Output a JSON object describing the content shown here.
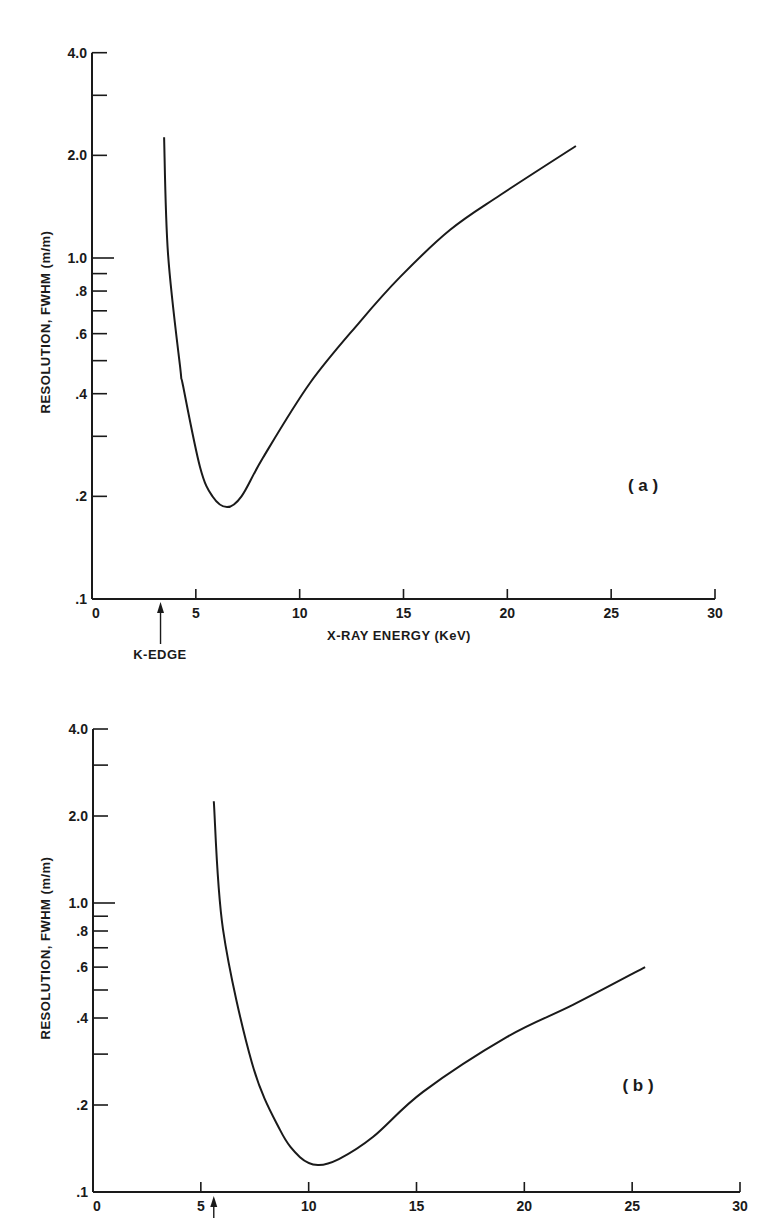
{
  "chart_data": [
    {
      "type": "line",
      "panel": "(a)",
      "title": "",
      "xlabel": "X-RAY ENERGY (KeV)",
      "ylabel": "RESOLUTION, FWHM (m/m)",
      "xscale": "linear",
      "yscale": "log",
      "xlim": [
        0,
        30
      ],
      "ylim": [
        0.1,
        4.0
      ],
      "xticks": [
        0,
        5,
        10,
        15,
        20,
        25,
        30
      ],
      "xtick_labels": [
        "0",
        "5",
        "10",
        "15",
        "20",
        "25",
        "30"
      ],
      "yticks_labeled": [
        0.1,
        0.2,
        0.4,
        0.6,
        0.8,
        1.0,
        2.0,
        4.0
      ],
      "ytick_labels": [
        ".1",
        ".2",
        ".4",
        ".6",
        ".8",
        "1.0",
        "2.0",
        "4.0"
      ],
      "yticks_minor": [
        0.3,
        0.5,
        0.7,
        0.9,
        3.0
      ],
      "grid": false,
      "annotations": [
        {
          "text": "K-EDGE",
          "x": 3.3,
          "type": "arrow-up"
        }
      ],
      "series": [
        {
          "name": "resolution",
          "x": [
            3.47,
            3.66,
            4.24,
            4.39,
            5.2,
            5.8,
            6.5,
            7.2,
            8.24,
            10.5,
            12.9,
            14.84,
            17.25,
            19.66,
            23.3
          ],
          "y": [
            2.26,
            1.03,
            0.48,
            0.42,
            0.244,
            0.2,
            0.186,
            0.2,
            0.26,
            0.43,
            0.65,
            0.88,
            1.21,
            1.53,
            2.13
          ]
        }
      ]
    },
    {
      "type": "line",
      "panel": "(b)",
      "title": "",
      "xlabel": "",
      "ylabel": "RESOLUTION, FWHM (m/m)",
      "xscale": "linear",
      "yscale": "log",
      "xlim": [
        0,
        30
      ],
      "ylim": [
        0.1,
        4.0
      ],
      "xticks": [
        0,
        5,
        10,
        15,
        20,
        25,
        30
      ],
      "xtick_labels": [
        "0",
        "5",
        "10",
        "15",
        "20",
        "25",
        "30"
      ],
      "yticks_labeled": [
        0.1,
        0.2,
        0.4,
        0.6,
        0.8,
        1.0,
        2.0,
        4.0
      ],
      "ytick_labels": [
        ".1",
        ".2",
        ".4",
        ".6",
        ".8",
        "1.0",
        "2.0",
        "4.0"
      ],
      "yticks_minor": [
        0.3,
        0.5,
        0.7,
        0.9,
        3.0
      ],
      "grid": false,
      "annotations": [
        {
          "text": "",
          "x": 5.6,
          "type": "arrow-up"
        }
      ],
      "series": [
        {
          "name": "resolution",
          "x": [
            5.6,
            6.03,
            7.37,
            8.67,
            9.6,
            10.43,
            11.4,
            12.98,
            15.3,
            19.2,
            22.25,
            25.6
          ],
          "y": [
            2.25,
            0.81,
            0.28,
            0.164,
            0.132,
            0.124,
            0.13,
            0.155,
            0.222,
            0.344,
            0.444,
            0.6
          ]
        }
      ]
    }
  ],
  "labels": {
    "top_ylabel": "RESOLUTION, FWHM (m/m)",
    "bottom_ylabel": "RESOLUTION, FWHM (m/m)",
    "top_xlabel": "X-RAY ENERGY (KeV)",
    "k_edge": "K-EDGE",
    "panel_a": "( a )",
    "panel_b": "( b )"
  }
}
